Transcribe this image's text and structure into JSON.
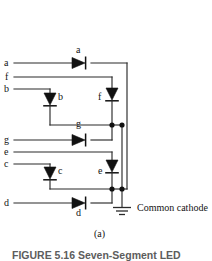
{
  "figure": {
    "domain": "Diagram",
    "title_caption": "FIGURE 5.16  Seven-Segment LED",
    "subfigure_label": "(a)",
    "common_cathode_label": "Common cathode",
    "background_color": "#ffffff",
    "line_color": "#2a2a2a",
    "diode_fill_color": "#111111"
  },
  "input_terminals": [
    {
      "id": "a",
      "label": "a",
      "x": 6,
      "y": 63
    },
    {
      "id": "f",
      "label": "f",
      "x": 6,
      "y": 77
    },
    {
      "id": "b",
      "label": "b",
      "x": 6,
      "y": 89
    },
    {
      "id": "g",
      "label": "g",
      "x": 6,
      "y": 140
    },
    {
      "id": "e",
      "label": "e",
      "x": 6,
      "y": 152
    },
    {
      "id": "c",
      "label": "c",
      "x": 6,
      "y": 164
    },
    {
      "id": "d",
      "label": "d",
      "x": 6,
      "y": 203
    }
  ],
  "diodes": [
    {
      "id": "a",
      "label": "a",
      "orientation": "horizontal-right",
      "label_x": 78,
      "label_y": 51,
      "label_pos": "above"
    },
    {
      "id": "b",
      "label": "b",
      "orientation": "vertical-down",
      "label_x": 57,
      "label_y": 95,
      "label_pos": "right"
    },
    {
      "id": "f",
      "label": "f",
      "orientation": "vertical-down",
      "label_x": 103,
      "label_y": 95,
      "label_pos": "left"
    },
    {
      "id": "g",
      "label": "g",
      "orientation": "horizontal-right",
      "label_x": 78,
      "label_y": 126,
      "label_pos": "above"
    },
    {
      "id": "c",
      "label": "c",
      "orientation": "vertical-down",
      "label_x": 57,
      "label_y": 168,
      "label_pos": "right"
    },
    {
      "id": "e",
      "label": "e",
      "orientation": "vertical-down",
      "label_x": 103,
      "label_y": 168,
      "label_pos": "left"
    },
    {
      "id": "d",
      "label": "d",
      "orientation": "horizontal-right",
      "label_x": 78,
      "label_y": 211,
      "label_pos": "below"
    }
  ],
  "junction_nodes": [
    {
      "id": "node-g-left",
      "x": 112,
      "y": 125
    },
    {
      "id": "node-g-right",
      "x": 122,
      "y": 125
    },
    {
      "id": "node-d-left",
      "x": 112,
      "y": 189
    },
    {
      "id": "node-d-right",
      "x": 122,
      "y": 189
    }
  ],
  "ground_symbol": {
    "id": "ground",
    "x": 122,
    "y": 207,
    "bars": 3
  }
}
